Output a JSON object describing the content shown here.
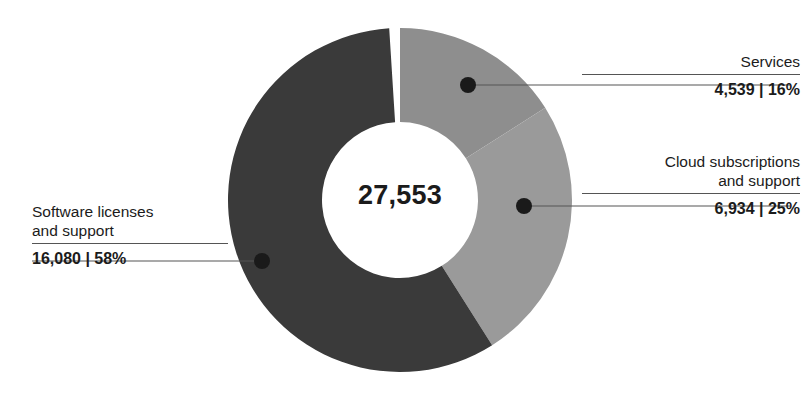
{
  "chart_data": {
    "type": "pie",
    "variant": "donut",
    "title": "",
    "subtitle": "",
    "xlabel": "",
    "ylabel": "",
    "legend_position": "callouts",
    "grid": false,
    "center_label": "27,553",
    "center_total": 27553,
    "start_angle_deg": 0,
    "direction": "clockwise",
    "categories": [
      "Services",
      "Cloud subscriptions and support",
      "Software licenses and support"
    ],
    "values": [
      4539,
      6934,
      16080
    ],
    "percents": [
      16,
      25,
      58
    ],
    "colors": [
      "#8e8e8e",
      "#9a9a9a",
      "#3a3a3a"
    ],
    "slices": [
      {
        "name": "Services",
        "label_lines": [
          "Services"
        ],
        "value": 4539,
        "value_label": "4,539",
        "percent": 16,
        "percent_label": "16%",
        "value_line": "4,539 | 16%",
        "color": "#8e8e8e"
      },
      {
        "name": "Cloud subscriptions and support",
        "label_lines": [
          "Cloud subscriptions",
          "and support"
        ],
        "value": 6934,
        "value_label": "6,934",
        "percent": 25,
        "percent_label": "25%",
        "value_line": "6,934 | 25%",
        "color": "#9a9a9a"
      },
      {
        "name": "Software licenses and support",
        "label_lines": [
          "Software licenses",
          "and support"
        ],
        "value": 16080,
        "value_label": "16,080",
        "percent": 58,
        "percent_label": "58%",
        "value_line": "16,080 | 58%",
        "color": "#3a3a3a"
      }
    ]
  },
  "callouts": {
    "services": {
      "line1": "Services",
      "line2": "",
      "value": "4,539 | 16%"
    },
    "cloud": {
      "line1": "Cloud subscriptions",
      "line2": "and support",
      "value": "6,934 | 25%"
    },
    "software": {
      "line1": "Software licenses",
      "line2": "and support",
      "value": "16,080 | 58%"
    }
  },
  "center": {
    "total": "27,553"
  },
  "style": {
    "background": "#ffffff",
    "text_color": "#1b1b1b",
    "leader_color": "#555555",
    "dot_color": "#1a1a1a"
  }
}
